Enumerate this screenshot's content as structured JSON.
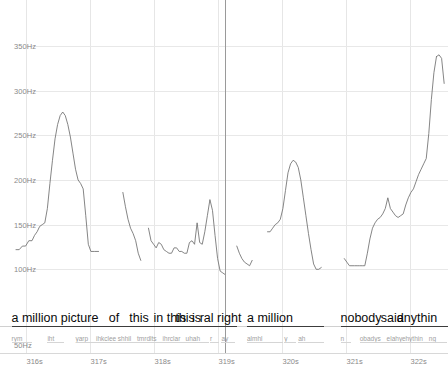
{
  "view": {
    "title": "pitch-contour-viewer",
    "accent_color": "#6f6f6f",
    "grid_color": "#e6e6e6",
    "cursor_color": "#9a9a9a",
    "cursor_time_label": "319.12s"
  },
  "chart_data": {
    "type": "line",
    "title": "",
    "xlabel": "",
    "ylabel": "",
    "xlim": [
      315.6,
      322.6
    ],
    "ylim": [
      50,
      370
    ],
    "grid": true,
    "legend": null,
    "y_ticks": [
      "350Hz",
      "300Hz",
      "250Hz",
      "200Hz",
      "150Hz",
      "100Hz",
      "50Hz"
    ],
    "y_tick_values": [
      350,
      300,
      250,
      200,
      150,
      100,
      50
    ],
    "x_ticks": [
      "316s",
      "317s",
      "318s",
      "319s",
      "320s",
      "321s",
      "322s"
    ],
    "x_tick_values": [
      316,
      317,
      318,
      319,
      320,
      321,
      322
    ],
    "series": [
      {
        "name": "F0",
        "units": "Hz",
        "segments": [
          {
            "x": [
              315.85,
              315.9,
              315.95,
              316.0,
              316.05,
              316.1,
              316.14,
              316.18,
              316.22,
              316.26,
              316.3,
              316.34,
              316.38,
              316.42,
              316.46,
              316.5,
              316.54,
              316.58,
              316.62,
              316.66,
              316.7,
              316.74,
              316.78,
              316.82,
              316.86,
              316.9,
              316.94,
              316.98,
              317.02,
              317.08,
              317.14
            ],
            "y": [
              122,
              122,
              126,
              126,
              132,
              132,
              138,
              142,
              148,
              150,
              152,
              168,
              196,
              222,
              246,
              262,
              272,
              276,
              272,
              262,
              248,
              230,
              212,
              200,
              196,
              190,
              160,
              128,
              120,
              120,
              120
            ]
          },
          {
            "x": [
              317.52,
              317.56,
              317.6,
              317.64,
              317.68,
              317.72,
              317.76,
              317.8
            ],
            "y": [
              186,
              170,
              156,
              146,
              140,
              132,
              118,
              110
            ]
          },
          {
            "x": [
              317.92,
              317.96,
              318.0,
              318.04,
              318.08,
              318.12,
              318.16,
              318.2,
              318.24,
              318.28,
              318.32,
              318.36,
              318.4,
              318.44,
              318.48,
              318.52,
              318.56,
              318.6,
              318.64,
              318.68,
              318.72,
              318.76,
              318.8,
              318.84,
              318.88,
              318.92,
              318.96,
              319.0,
              319.04,
              319.08,
              319.12
            ],
            "y": [
              146,
              132,
              128,
              124,
              130,
              128,
              122,
              120,
              118,
              118,
              124,
              124,
              120,
              120,
              118,
              118,
              130,
              132,
              128,
              152,
              130,
              128,
              142,
              160,
              178,
              166,
              138,
              112,
              98,
              96,
              94
            ]
          },
          {
            "x": [
              319.3,
              319.34,
              319.38,
              319.42,
              319.46,
              319.5,
              319.54
            ],
            "y": [
              126,
              118,
              112,
              108,
              106,
              104,
              110
            ]
          },
          {
            "x": [
              319.78,
              319.82,
              319.86,
              319.9,
              319.94,
              319.98,
              320.02,
              320.06,
              320.1,
              320.14,
              320.18,
              320.22,
              320.26,
              320.3,
              320.34,
              320.38,
              320.42,
              320.46,
              320.5,
              320.54,
              320.58,
              320.62
            ],
            "y": [
              142,
              142,
              146,
              150,
              152,
              156,
              168,
              188,
              208,
              218,
              222,
              220,
              214,
              200,
              180,
              160,
              140,
              122,
              106,
              100,
              100,
              102
            ]
          },
          {
            "x": [
              320.98,
              321.02,
              321.06,
              321.1,
              321.14,
              321.18,
              321.22,
              321.26,
              321.3,
              321.34,
              321.38,
              321.42,
              321.46,
              321.5,
              321.54,
              321.58,
              321.62,
              321.66,
              321.7,
              321.74,
              321.78,
              321.82,
              321.86,
              321.9,
              321.94,
              321.98,
              322.02,
              322.06,
              322.1,
              322.14,
              322.18,
              322.22,
              322.26,
              322.3,
              322.34,
              322.38,
              322.42
            ],
            "y": [
              112,
              108,
              104,
              104,
              104,
              104,
              104,
              104,
              104,
              118,
              134,
              146,
              152,
              156,
              158,
              162,
              168,
              180,
              168,
              164,
              160,
              158,
              160,
              162,
              172,
              180,
              186,
              190,
              198,
              206,
              212,
              218,
              224,
              252,
              290,
              320,
              338
            ]
          },
          {
            "x": [
              322.42,
              322.46,
              322.5,
              322.54
            ],
            "y": [
              338,
              340,
              336,
              308
            ]
          }
        ]
      }
    ]
  },
  "tiers": {
    "word_tier_name": "words",
    "phone_tier_name": "phones",
    "words": [
      {
        "label": "a million picture",
        "start": 315.78,
        "end": 317.72
      },
      {
        "label": "of",
        "start": 317.3,
        "end": 317.62
      },
      {
        "label": "this",
        "start": 317.62,
        "end": 318.0
      },
      {
        "label": "in this",
        "start": 318.0,
        "end": 318.42
      },
      {
        "label": "this",
        "start": 318.34,
        "end": 318.72
      },
      {
        "label": "is",
        "start": 318.6,
        "end": 318.86
      },
      {
        "label": "ral right",
        "start": 318.72,
        "end": 319.3
      },
      {
        "label": "a million",
        "start": 319.46,
        "end": 320.66
      },
      {
        "label": "nobody",
        "start": 320.92,
        "end": 321.72
      },
      {
        "label": "said",
        "start": 321.55,
        "end": 321.96
      },
      {
        "label": "anythin",
        "start": 321.8,
        "end": 322.6
      }
    ],
    "phones": [
      {
        "label": "rym",
        "start": 315.78,
        "end": 316.1
      },
      {
        "label": "iht",
        "start": 316.34,
        "end": 316.6
      },
      {
        "label": "yarp",
        "start": 316.78,
        "end": 317.14
      },
      {
        "label": "ihkclee",
        "start": 317.1,
        "end": 317.52
      },
      {
        "label": "shhil",
        "start": 317.44,
        "end": 317.8
      },
      {
        "label": "tmrdlts",
        "start": 317.74,
        "end": 318.16
      },
      {
        "label": "ihrclar",
        "start": 318.14,
        "end": 318.52
      },
      {
        "label": "uhah",
        "start": 318.5,
        "end": 318.86
      },
      {
        "label": "r",
        "start": 318.88,
        "end": 319.02
      },
      {
        "label": "ay",
        "start": 319.06,
        "end": 319.28
      },
      {
        "label": "almhl",
        "start": 319.46,
        "end": 320.02
      },
      {
        "label": "y",
        "start": 320.04,
        "end": 320.22
      },
      {
        "label": "ah",
        "start": 320.26,
        "end": 320.66
      },
      {
        "label": "n",
        "start": 320.92,
        "end": 321.08
      },
      {
        "label": "obadys",
        "start": 321.22,
        "end": 321.7
      },
      {
        "label": "elahy",
        "start": 321.64,
        "end": 321.96
      },
      {
        "label": "ehythin",
        "start": 321.88,
        "end": 322.3
      },
      {
        "label": "ng",
        "start": 322.3,
        "end": 322.58
      }
    ]
  },
  "cursor": {
    "time": 319.12
  }
}
